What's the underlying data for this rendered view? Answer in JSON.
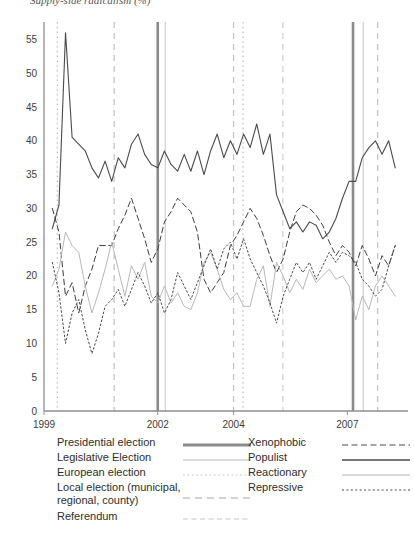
{
  "title_partial": "Supply-side radicalism (%)",
  "chart_data": {
    "type": "line",
    "title": "",
    "xlabel": "",
    "ylabel": "",
    "ylim": [
      0,
      57
    ],
    "xlim": [
      1999,
      2008.6
    ],
    "grid": false,
    "legend_position": "bottom",
    "y_ticks": [
      0,
      5,
      10,
      15,
      20,
      25,
      30,
      35,
      40,
      45,
      50,
      55
    ],
    "x_ticks": [
      1999,
      2002,
      2004,
      2007
    ],
    "x_tick_labels": [
      "1999",
      "2002",
      "2004",
      "2007"
    ],
    "series": [
      {
        "name": "Populist",
        "style": "solid",
        "color": "#4a4a4a",
        "width": 1.1,
        "values": [
          27.0,
          30.5,
          56.0,
          40.5,
          39.5,
          38.5,
          36.0,
          34.5,
          37.0,
          34.0,
          37.5,
          36.0,
          39.5,
          41.0,
          38.0,
          36.5,
          36.0,
          38.5,
          36.5,
          35.5,
          38.0,
          35.5,
          38.5,
          35.0,
          38.5,
          41.0,
          37.5,
          40.0,
          38.0,
          41.0,
          39.0,
          42.5,
          38.0,
          41.0,
          32.0,
          29.5,
          27.0,
          28.0,
          26.5,
          28.0,
          27.5,
          25.5,
          26.5,
          28.5,
          31.5,
          34.0,
          34.0,
          37.5,
          39.0,
          40.0,
          38.0,
          40.0,
          36.0
        ]
      },
      {
        "name": "Xenophobic",
        "style": "dashed",
        "color": "#3d3d3d",
        "width": 1.0,
        "values": [
          30.0,
          26.5,
          17.0,
          19.0,
          14.5,
          18.5,
          21.0,
          24.5,
          24.5,
          24.5,
          27.0,
          29.0,
          31.5,
          28.5,
          25.5,
          22.0,
          24.0,
          28.0,
          29.5,
          31.5,
          30.5,
          29.5,
          26.5,
          19.5,
          17.5,
          19.0,
          20.5,
          24.5,
          26.0,
          28.0,
          30.0,
          28.5,
          26.0,
          23.0,
          20.5,
          22.5,
          26.5,
          29.5,
          30.5,
          30.0,
          29.0,
          27.5,
          25.0,
          23.0,
          24.5,
          23.5,
          21.5,
          24.5,
          22.5,
          20.0,
          23.0,
          21.5,
          24.5
        ]
      },
      {
        "name": "Reactionary",
        "style": "solid",
        "color": "#b8b8b8",
        "width": 1.0,
        "values": [
          18.5,
          21.0,
          26.5,
          24.5,
          23.5,
          18.5,
          14.5,
          17.5,
          21.0,
          25.0,
          21.0,
          17.0,
          21.5,
          19.5,
          22.0,
          17.0,
          16.0,
          18.5,
          16.0,
          17.5,
          15.5,
          15.0,
          17.5,
          22.0,
          23.5,
          21.0,
          18.0,
          16.5,
          17.5,
          15.5,
          15.5,
          19.5,
          21.5,
          15.5,
          22.0,
          20.0,
          17.5,
          19.5,
          18.0,
          21.0,
          19.0,
          20.0,
          21.0,
          19.5,
          20.0,
          18.5,
          13.5,
          17.0,
          15.0,
          18.5,
          20.0,
          18.5,
          17.0
        ]
      },
      {
        "name": "Repressive",
        "style": "dotted",
        "color": "#4a4a4a",
        "width": 1.0,
        "values": [
          22.0,
          17.5,
          10.0,
          14.5,
          16.5,
          12.0,
          8.5,
          11.5,
          15.5,
          16.5,
          18.0,
          15.5,
          18.0,
          20.5,
          18.5,
          16.0,
          17.5,
          14.5,
          16.5,
          20.5,
          18.5,
          16.5,
          19.0,
          21.5,
          24.0,
          21.0,
          24.0,
          25.0,
          22.5,
          25.5,
          22.5,
          20.5,
          18.5,
          16.0,
          13.0,
          17.0,
          19.5,
          22.0,
          20.5,
          22.0,
          19.5,
          21.5,
          23.5,
          22.0,
          23.5,
          23.0,
          22.0,
          19.5,
          18.5,
          17.0,
          18.0,
          21.5,
          24.5
        ]
      }
    ],
    "event_lines": [
      {
        "type": "european-election",
        "x": 1999.35,
        "style": "dotted",
        "color": "#b4b4b4",
        "width": 1.0
      },
      {
        "type": "local-election",
        "x": 2000.85,
        "style": "dashed",
        "color": "#c0c0c0",
        "width": 1.2
      },
      {
        "type": "presidential-election",
        "x": 2002.0,
        "style": "solid",
        "color": "#8a8a8a",
        "width": 2.6
      },
      {
        "type": "legislative-election",
        "x": 2002.2,
        "style": "solid",
        "color": "#cfcfcf",
        "width": 1.2
      },
      {
        "type": "local-election",
        "x": 2004.0,
        "style": "dashed",
        "color": "#c0c0c0",
        "width": 1.2
      },
      {
        "type": "european-election",
        "x": 2004.25,
        "style": "dotted",
        "color": "#b4b4b4",
        "width": 1.0
      },
      {
        "type": "referendum",
        "x": 2005.3,
        "style": "dashed",
        "color": "#c4c4c4",
        "width": 1.0
      },
      {
        "type": "presidential-election",
        "x": 2007.15,
        "style": "solid",
        "color": "#8a8a8a",
        "width": 2.6
      },
      {
        "type": "legislative-election",
        "x": 2007.42,
        "style": "solid",
        "color": "#cfcfcf",
        "width": 1.2
      },
      {
        "type": "local-election",
        "x": 2007.8,
        "style": "dashed",
        "color": "#c0c0c0",
        "width": 1.2
      }
    ]
  },
  "legend": {
    "left_column": [
      {
        "label": "Presidential election",
        "key": "solid-thick-dark"
      },
      {
        "label": "Legislative Election",
        "key": "solid-thin-light"
      },
      {
        "label": "European election",
        "key": "dotted-light"
      },
      {
        "label": "Local election (municipal,\nregional, county)",
        "key": "dashed-light"
      },
      {
        "label": "Referendum",
        "key": "dashed-fine-light"
      }
    ],
    "right_column": [
      {
        "label": "Xenophobic",
        "key": "dashed-dark"
      },
      {
        "label": "Populist",
        "key": "solid-dark"
      },
      {
        "label": "Reactionary",
        "key": "solid-light"
      },
      {
        "label": "Repressive",
        "key": "dotted-dark"
      }
    ]
  }
}
